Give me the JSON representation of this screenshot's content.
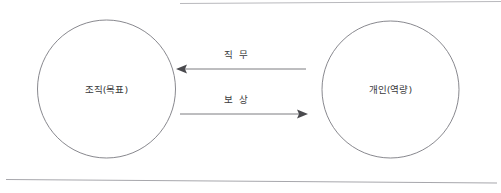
{
  "diagram": {
    "type": "relationship-diagram",
    "nodes": [
      {
        "id": "organization",
        "label": "조직(목표)",
        "cx": 106.5,
        "cy": 89,
        "r": 69
      },
      {
        "id": "individual",
        "label": "개인(역량)",
        "cx": 390.5,
        "cy": 89.5,
        "r": 68.5
      }
    ],
    "edges": [
      {
        "id": "job",
        "label": "직 무",
        "from": "individual",
        "to": "organization",
        "direction": "left",
        "y": 69,
        "x_start": 306,
        "x_end": 177,
        "label_x": 237,
        "label_y": 58
      },
      {
        "id": "reward",
        "label": "보 상",
        "from": "organization",
        "to": "individual",
        "direction": "right",
        "y": 114,
        "x_start": 180,
        "x_end": 307,
        "label_x": 237,
        "label_y": 103
      }
    ],
    "rules": [
      {
        "id": "top-rule",
        "x1": 180,
        "y1": 3.5,
        "x2": 501,
        "y2": 1.5
      },
      {
        "id": "bottom-rule",
        "x1": 6,
        "y1": 179.5,
        "x2": 497,
        "y2": 183
      }
    ]
  }
}
